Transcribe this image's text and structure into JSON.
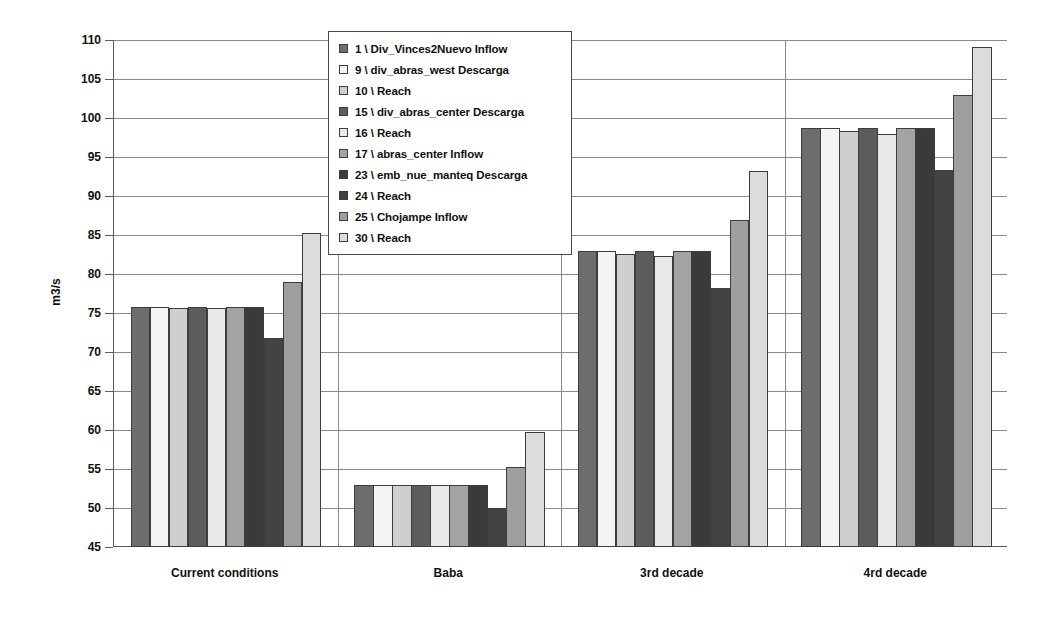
{
  "chart_data": {
    "type": "bar",
    "title": "",
    "xlabel": "",
    "ylabel": "m3/s",
    "ylim": [
      45,
      110
    ],
    "ytick_step": 5,
    "yticks": [
      45,
      50,
      55,
      60,
      65,
      70,
      75,
      80,
      85,
      90,
      95,
      100,
      105,
      110
    ],
    "grid": "horizontal-and-category-separators",
    "legend_position": "top-center-inside",
    "categories": [
      "Current conditions",
      "Baba",
      "3rd decade",
      "4rd decade"
    ],
    "series": [
      {
        "name": "1 \\ Div_Vinces2Nuevo Inflow",
        "color": "#6d6d6d",
        "values": [
          75.8,
          53.0,
          82.9,
          98.7
        ]
      },
      {
        "name": "9 \\ div_abras_west Descarga",
        "color": "#f4f4f4",
        "values": [
          75.8,
          53.0,
          82.9,
          98.7
        ]
      },
      {
        "name": "10 \\ Reach",
        "color": "#cfcfcf",
        "values": [
          75.7,
          53.0,
          82.6,
          98.3
        ]
      },
      {
        "name": "15 \\ div_abras_center Descarga",
        "color": "#5c5c5c",
        "values": [
          75.8,
          53.0,
          82.9,
          98.7
        ]
      },
      {
        "name": "16 \\ Reach",
        "color": "#e9e9e9",
        "values": [
          75.6,
          53.0,
          82.3,
          98.0
        ]
      },
      {
        "name": "17 \\ abras_center Inflow",
        "color": "#a3a3a3",
        "values": [
          75.8,
          53.0,
          82.9,
          98.7
        ]
      },
      {
        "name": "23 \\ emb_nue_manteq Descarga",
        "color": "#3a3a3a",
        "values": [
          75.8,
          53.0,
          82.9,
          98.7
        ]
      },
      {
        "name": "24 \\ Reach",
        "color": "#434343",
        "values": [
          71.8,
          50.0,
          78.2,
          93.3
        ]
      },
      {
        "name": "25 \\ Chojampe Inflow",
        "color": "#9e9e9e",
        "values": [
          79.0,
          55.2,
          86.9,
          102.9
        ]
      },
      {
        "name": "30 \\ Reach",
        "color": "#dcdcdc",
        "values": [
          85.2,
          59.7,
          93.2,
          109.1
        ]
      }
    ]
  },
  "legend": {
    "items": [
      {
        "label": "1 \\ Div_Vinces2Nuevo Inflow"
      },
      {
        "label": "9 \\ div_abras_west Descarga"
      },
      {
        "label": "10 \\ Reach"
      },
      {
        "label": "15 \\ div_abras_center Descarga"
      },
      {
        "label": "16 \\ Reach"
      },
      {
        "label": "17 \\ abras_center Inflow"
      },
      {
        "label": "23 \\ emb_nue_manteq Descarga"
      },
      {
        "label": "24 \\ Reach"
      },
      {
        "label": "25 \\ Chojampe Inflow"
      },
      {
        "label": "30 \\ Reach"
      }
    ]
  },
  "axis": {
    "y_title": "m3/s"
  },
  "style": {
    "axis_color": "#5a5a5a",
    "grid_color": "#8a8a8a",
    "bar_border": "#3d3d3d",
    "text_color": "#111111",
    "background": "#ffffff"
  }
}
